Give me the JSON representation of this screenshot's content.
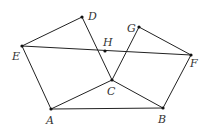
{
  "diagram": {
    "width": 208,
    "height": 139,
    "stroke_color": "#222222",
    "point_color": "#111111",
    "points": [
      {
        "name": "A",
        "x": 51,
        "y": 109,
        "label_x": 46,
        "label_y": 124
      },
      {
        "name": "B",
        "x": 163,
        "y": 108,
        "label_x": 158,
        "label_y": 123
      },
      {
        "name": "C",
        "x": 112,
        "y": 80,
        "label_x": 107,
        "label_y": 95
      },
      {
        "name": "D",
        "x": 82,
        "y": 17,
        "label_x": 88,
        "label_y": 20
      },
      {
        "name": "E",
        "x": 22,
        "y": 46,
        "label_x": 12,
        "label_y": 60
      },
      {
        "name": "F",
        "x": 191,
        "y": 55,
        "label_x": 190,
        "label_y": 67
      },
      {
        "name": "G",
        "x": 139,
        "y": 27,
        "label_x": 127,
        "label_y": 32
      },
      {
        "name": "H",
        "x": 105,
        "y": 51,
        "label_x": 103,
        "label_y": 46
      }
    ],
    "segments": [
      [
        "E",
        "D"
      ],
      [
        "D",
        "C"
      ],
      [
        "E",
        "F"
      ],
      [
        "E",
        "A"
      ],
      [
        "A",
        "C"
      ],
      [
        "A",
        "B"
      ],
      [
        "C",
        "B"
      ],
      [
        "B",
        "F"
      ],
      [
        "F",
        "G"
      ],
      [
        "G",
        "C"
      ]
    ]
  }
}
